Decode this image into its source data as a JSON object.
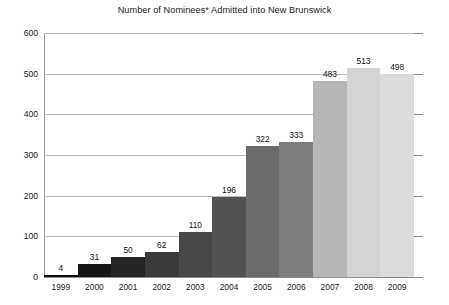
{
  "chart_data": {
    "type": "bar",
    "title": "Number of Nominees* Admitted into New Brunswick",
    "xlabel": "",
    "ylabel": "",
    "categories": [
      "1999",
      "2000",
      "2001",
      "2002",
      "2003",
      "2004",
      "2005",
      "2006",
      "2007",
      "2008",
      "2009"
    ],
    "values": [
      4,
      31,
      50,
      62,
      110,
      196,
      322,
      333,
      483,
      513,
      498
    ],
    "ylim": [
      0,
      600
    ],
    "yticks": [
      0,
      100,
      200,
      300,
      400,
      500,
      600
    ],
    "ytick_labels": [
      "0",
      "100",
      "200",
      "300",
      "400",
      "500",
      "600"
    ],
    "grid": true,
    "legend": false,
    "bar_colors": [
      "#0d0d0d",
      "#151515",
      "#242424",
      "#3a3a3a",
      "#474747",
      "#525252",
      "#6b6b6b",
      "#7e7e7e",
      "#b6b6b6",
      "#d3d3d3",
      "#dcdcdc"
    ],
    "axis_color": "#9a9a9a",
    "gridline_color": "#b9b9b9",
    "text_color": "#1b1b1b",
    "background": "#ffffff"
  }
}
